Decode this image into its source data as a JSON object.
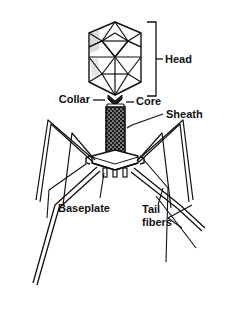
{
  "figure": {
    "type": "labeled-biological-diagram",
    "background_color": "#ffffff",
    "line_color": "#111111",
    "fill_shade_color": "#9a9a9a",
    "sheath_fill_color": "#1a1a1a"
  },
  "labels": {
    "head": "Head",
    "collar": "Collar",
    "core": "Core",
    "sheath": "Sheath",
    "baseplate": "Baseplate",
    "tail_fibers_line1": "Tail",
    "tail_fibers_line2": "fibers"
  },
  "parts": [
    {
      "key": "head",
      "label": "Head",
      "connector": "bracket",
      "side": "right"
    },
    {
      "key": "collar",
      "label": "Collar",
      "connector": "dash",
      "side": "left"
    },
    {
      "key": "core",
      "label": "Core",
      "connector": "dash",
      "side": "right"
    },
    {
      "key": "sheath",
      "label": "Sheath",
      "connector": "leader-line",
      "side": "right"
    },
    {
      "key": "baseplate",
      "label": "Baseplate",
      "connector": "leader-line",
      "side": "left"
    },
    {
      "key": "tail_fibers",
      "label": "Tail fibers",
      "connector": "leader-line",
      "side": "right"
    }
  ]
}
